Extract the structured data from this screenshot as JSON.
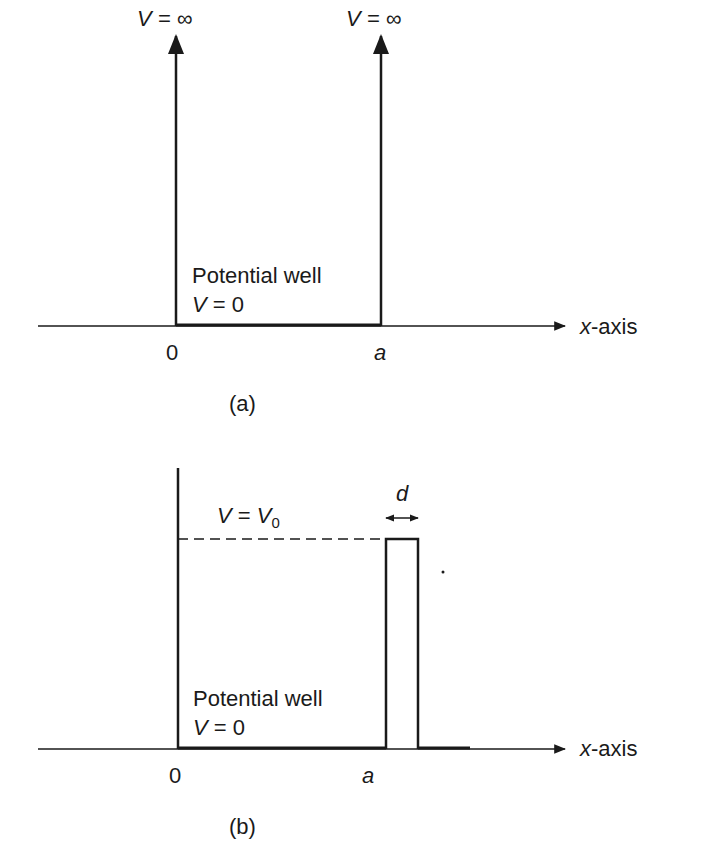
{
  "panel_a": {
    "caption": "(a)",
    "left_wall_label": "V = ∞",
    "right_wall_label": "V = ∞",
    "well_label_line1": "Potential well",
    "well_label_line2_var": "V",
    "well_label_line2_rest": " = 0",
    "origin_label": "0",
    "a_label": "a",
    "axis_label_var": "x",
    "axis_label_rest": "-axis"
  },
  "panel_b": {
    "caption": "(b)",
    "barrier_label_var": "V",
    "barrier_label_eq": " = ",
    "barrier_label_v0": "V",
    "barrier_label_sub": "0",
    "width_label": "d",
    "well_label_line1": "Potential well",
    "well_label_line2_var": "V",
    "well_label_line2_rest": " = 0",
    "origin_label": "0",
    "a_label": "a",
    "axis_label_var": "x",
    "axis_label_rest": "-axis"
  },
  "colors": {
    "ink": "#1a1a1a",
    "background": "#ffffff"
  }
}
